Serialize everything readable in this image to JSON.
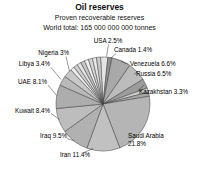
{
  "header": {
    "title": "Oil reserves",
    "subtitle": "Proven recoverable reserves",
    "world_total": "World total: 165 000 000 000 tonnes"
  },
  "colors": {
    "background": "#ffffff",
    "text": "#111111",
    "slice_outline": "#3c3c3c",
    "leader_line": "#333333"
  },
  "chart_data": {
    "type": "pie",
    "title": "Oil reserves",
    "subtitle": "Proven recoverable reserves",
    "note": "World total: 165 000 000 000 tonnes",
    "unit": "%",
    "legend_position": "none",
    "start_angle_deg_from_12_clockwise": -3,
    "direction": "clockwise",
    "center": {
      "x": 103,
      "y": 104
    },
    "radius": 47,
    "slices": [
      {
        "label": "USA",
        "value": 2.5,
        "color": "#e4e4e4"
      },
      {
        "label": "Canada",
        "value": 1.4,
        "color": "#8f8f8f"
      },
      {
        "label": "Venezuela",
        "value": 6.6,
        "color": "#a9a9a9"
      },
      {
        "label": "Russia",
        "value": 6.5,
        "color": "#bcbcbc"
      },
      {
        "label": "Kazakhstan",
        "value": 3.3,
        "color": "#9c9c9c"
      },
      {
        "label": "",
        "value": 1.45,
        "color": "#cdcdcd"
      },
      {
        "label": "",
        "value": 1.45,
        "color": "#a5a5a5"
      },
      {
        "label": "Saudi Arabia",
        "value": 21.8,
        "color": "#b5b5b5"
      },
      {
        "label": "Iran",
        "value": 11.4,
        "color": "#c1c1c1"
      },
      {
        "label": "Iraq",
        "value": 9.5,
        "color": "#b1b1b1"
      },
      {
        "label": "Kuwait",
        "value": 8.4,
        "color": "#bdbdbd"
      },
      {
        "label": "UAE",
        "value": 8.1,
        "color": "#adadad"
      },
      {
        "label": "Libya",
        "value": 3.4,
        "color": "#b9b9b9"
      },
      {
        "label": "Nigeria",
        "value": 3.0,
        "color": "#c8c8c8"
      },
      {
        "label": "",
        "value": 1.4,
        "color": "#eaeaea"
      },
      {
        "label": "",
        "value": 1.4,
        "color": "#cfcfcf"
      },
      {
        "label": "",
        "value": 1.4,
        "color": "#e3e3e3"
      },
      {
        "label": "",
        "value": 1.4,
        "color": "#c7c7c7"
      },
      {
        "label": "",
        "value": 1.4,
        "color": "#eeeeee"
      },
      {
        "label": "",
        "value": 1.4,
        "color": "#d4d4d4"
      },
      {
        "label": "",
        "value": 1.4,
        "color": "#e7e7e7"
      },
      {
        "label": "",
        "value": 1.4,
        "color": "#cbcbcb"
      }
    ],
    "labels": [
      {
        "text": "USA 2.5%",
        "x": 108,
        "y": 43,
        "anchor": "middle"
      },
      {
        "text": "Canada 1.4%",
        "x": 114,
        "y": 52,
        "anchor": "start"
      },
      {
        "text": "Venezuela 6.6%",
        "x": 130,
        "y": 66,
        "anchor": "start"
      },
      {
        "text": "Russia 6.5%",
        "x": 136,
        "y": 76,
        "anchor": "start"
      },
      {
        "text": "Kazakhstan 3.3%",
        "x": 139,
        "y": 94,
        "anchor": "start"
      },
      {
        "text": "Saudi Arabia",
        "x": 128,
        "y": 138,
        "anchor": "start"
      },
      {
        "text": "21.8%",
        "x": 128,
        "y": 146,
        "anchor": "start"
      },
      {
        "text": "Iran 11.4%",
        "x": 60,
        "y": 157,
        "anchor": "start"
      },
      {
        "text": "Iraq 9.5%",
        "x": 67,
        "y": 138,
        "anchor": "end"
      },
      {
        "text": "Kuwait 8.4%",
        "x": 50,
        "y": 113,
        "anchor": "end"
      },
      {
        "text": "UAE 8.1%",
        "x": 47,
        "y": 84,
        "anchor": "end"
      },
      {
        "text": "Libya 3.4%",
        "x": 50,
        "y": 66,
        "anchor": "end"
      },
      {
        "text": "Nigeria 3%",
        "x": 69,
        "y": 55,
        "anchor": "end"
      }
    ],
    "leaders": [
      [
        108.5,
        44.5,
        106.5,
        56.5
      ],
      [
        116,
        53.5,
        110.5,
        58.5
      ],
      [
        128.5,
        64,
        121,
        61.5
      ],
      [
        134,
        74.5,
        137.5,
        71.5
      ],
      [
        137.5,
        91,
        144,
        85
      ],
      [
        84,
        152.5,
        93,
        148.5
      ],
      [
        67,
        138.5,
        74.5,
        141
      ],
      [
        51,
        113.5,
        59.5,
        119.5
      ],
      [
        48,
        85,
        56.5,
        95.5
      ],
      [
        51,
        67.5,
        61,
        79.5
      ],
      [
        66,
        56.5,
        69.5,
        71.5
      ]
    ]
  }
}
